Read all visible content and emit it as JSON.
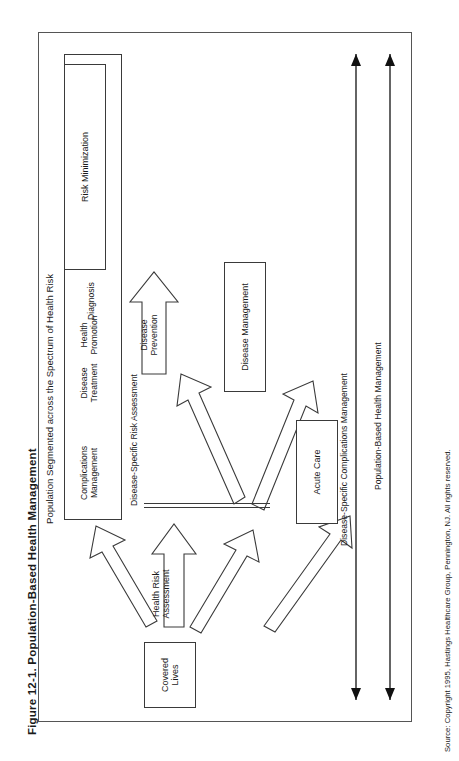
{
  "caption": {
    "figure_number": "Figure 12-1.",
    "title": "Population-Based Health Management",
    "full": "Figure 12-1.   Population-Based Health Management"
  },
  "source_note": "Source: Copyright 1995, Hastings Healthcare Group, Pennington, NJ. All rights reserved.",
  "diagram": {
    "input_box": "Covered\nLives",
    "assessment_label": "Health Risk\nAssessment",
    "spectrum_caption": "Population Segmented across the Spectrum of Health Risk",
    "spectrum_segments": [
      "Complications\nManagement",
      "Disease\nTreatment",
      "Diagnosis",
      "High",
      "Low",
      "Healthy"
    ],
    "secondary_assessment": "Disease-Specific Risk Assessment",
    "flow_arrows": [
      "Disease\nPrevention",
      "Health\nPromotion"
    ],
    "outcome_boxes": [
      "Acute Care",
      "Disease Management",
      "Risk Minimization"
    ],
    "span_arrows": [
      "Disease-Specific Complications Management",
      "Population-Based Health Management"
    ]
  },
  "colors": {
    "ink": "#1a1a1a",
    "stroke": "#3a3a3a",
    "frame": "#555555",
    "paper": "#ffffff"
  }
}
